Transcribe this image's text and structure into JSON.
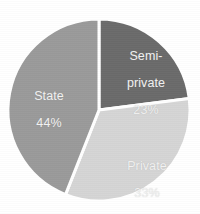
{
  "chart_data": {
    "type": "pie",
    "title": "",
    "subtitle": "",
    "xlabel": "",
    "ylabel": "",
    "legend_position": "none",
    "grid": false,
    "labels_inside_slices": true,
    "start_angle_deg": 0,
    "direction": "clockwise",
    "background_color": "#ffffff",
    "separator_color": "#ffffff",
    "label_text_color": "#f2f2f2",
    "categories": [
      "Semi-private",
      "Private",
      "State"
    ],
    "values": [
      23,
      33,
      44
    ],
    "value_unit": "%",
    "slices": [
      {
        "name": "Semi-private",
        "label": "Semi-\nprivate",
        "value": 23,
        "value_label": "23%",
        "color": "#6b6b6b",
        "start_deg": 0,
        "end_deg": 82.8
      },
      {
        "name": "Private",
        "label": "Private",
        "value": 33,
        "value_label": "33%",
        "color": "#d5d5d5",
        "start_deg": 82.8,
        "end_deg": 201.6
      },
      {
        "name": "State",
        "label": "State",
        "value": 44,
        "value_label": "44%",
        "color": "#9a9a9a",
        "start_deg": 201.6,
        "end_deg": 360
      }
    ]
  },
  "geometry": {
    "center_x": 99,
    "center_y": 110,
    "radius": 91
  },
  "labels": {
    "semi_private": {
      "name_line1": "Semi-",
      "name_line2": "private",
      "value": "23%"
    },
    "private": {
      "name": "Private",
      "value": "33%"
    },
    "state": {
      "name": "State",
      "value": "44%"
    }
  }
}
